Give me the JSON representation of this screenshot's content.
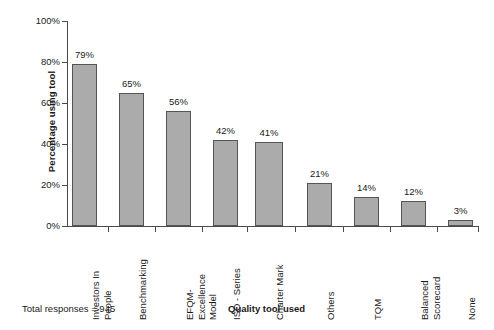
{
  "chart_data": {
    "type": "bar",
    "title": "",
    "xlabel": "Quality tool used",
    "ylabel": "Percentage using tool",
    "ylim": [
      0,
      100
    ],
    "yticks": [
      "0%",
      "20%",
      "40%",
      "60%",
      "80%",
      "100%"
    ],
    "ytick_values": [
      0,
      20,
      40,
      60,
      80,
      100
    ],
    "grid": false,
    "legend": "none",
    "bar_color": "#ababab",
    "bar_border_color": "#555555",
    "axis_color": "#4a4a4a",
    "categories": [
      "Investors In\nPeople",
      "Benchmarking",
      "EFQM-\nExcellence\nModel",
      "ISO - Series",
      "Charter Mark",
      "Others",
      "TQM",
      "Balanced\nScorecard",
      "None"
    ],
    "values": [
      79,
      65,
      56,
      42,
      41,
      21,
      14,
      12,
      3
    ],
    "value_labels": [
      "79%",
      "65%",
      "56%",
      "42%",
      "41%",
      "21%",
      "14%",
      "12%",
      "3%"
    ],
    "bar_count_note": "Charter Mark bar is drawn with extra width/overlap in the source figure",
    "annotations": [
      {
        "text": "Total responses = 945",
        "position": "bottom-left"
      }
    ]
  },
  "footer": {
    "total_responses": "Total responses = 945"
  },
  "axes": {
    "x_title": "Quality tool used",
    "y_title": "Percentage using tool"
  }
}
